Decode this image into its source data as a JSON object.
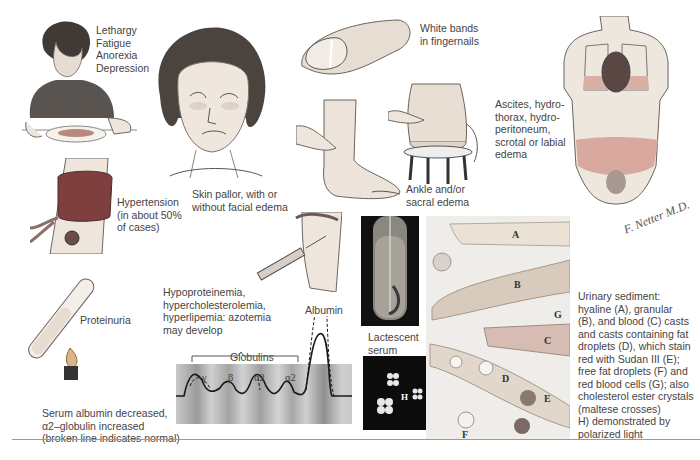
{
  "plate": {
    "title": "Nephrotic syndrome clinical manifestations",
    "signature": "F. Netter M.D."
  },
  "captions": {
    "lethargy": [
      "Lethargy",
      "Fatigue",
      "Anorexia",
      "Depression"
    ],
    "pallor": [
      "Skin pallor, with or",
      "without facial edema"
    ],
    "nails": [
      "White bands",
      "in fingernails"
    ],
    "edema_ankle": [
      "Ankle and/or",
      "sacral edema"
    ],
    "ascites": [
      "Ascites, hydro-",
      "thorax, hydro-",
      "peritoneum,",
      "scrotal or labial",
      "edema"
    ],
    "hypertension": [
      "Hypertension",
      "(in about 50%",
      "of cases)"
    ],
    "hypoproteinemia": [
      "Hypoproteinemia,",
      "hypercholesterolemia,",
      "hyperlipemia: azotemia",
      "may develop"
    ],
    "proteinuria": "Proteinuria",
    "lactescent": [
      "Lactescent",
      "serum"
    ],
    "serum": [
      "Serum albumin decreased,",
      "α2–globulin increased",
      "(broken line indicates normal)"
    ],
    "sediment": [
      "Urinary sediment:",
      "hyaline (A), granular",
      "(B), and blood (C) casts",
      "and casts containing fat",
      "droplets (D), which stain",
      "red with Sudan III (E);",
      "free fat droplets (F) and",
      "red blood cells (G); also",
      "cholesterol ester crystals",
      "(maltese crosses)",
      "H) demonstrated by",
      "polarized light"
    ]
  },
  "electrophoresis": {
    "group_label": "Globulins",
    "peak_label": "Albumin",
    "fractions": [
      "γ",
      "β",
      "α2",
      "α2"
    ]
  },
  "sediment_letters": [
    "A",
    "B",
    "C",
    "D",
    "E",
    "F",
    "G",
    "H"
  ],
  "colors": {
    "skin": "#eee6dc",
    "cuff": "#8a4a48",
    "edema_band": "#d9a9a0",
    "strip": "#bdbdbd",
    "dark_panel": "#111111",
    "sediment_bg": "#efedea"
  }
}
